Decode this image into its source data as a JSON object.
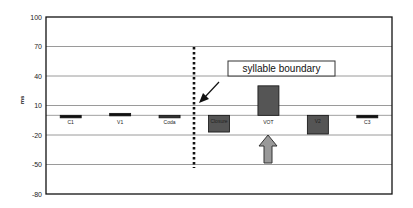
{
  "chart_data": {
    "type": "bar",
    "title": "",
    "xlabel": "",
    "ylabel": "ms",
    "ylim": [
      -80,
      100
    ],
    "yticks": [
      100,
      70,
      40,
      10,
      -20,
      -50,
      -80
    ],
    "grid": true,
    "legend": null,
    "categories": [
      "C1",
      "V1",
      "Coda",
      "Closure",
      "VOT",
      "V2",
      "C3"
    ],
    "values": [
      -1,
      2,
      -2,
      -17,
      30,
      -19,
      -1
    ],
    "bar_colors": [
      "#111111",
      "#111111",
      "#333333",
      "#555555",
      "#555555",
      "#555555",
      "#111111"
    ],
    "annotations": [
      {
        "type": "text_box",
        "text": "syllable boundary"
      },
      {
        "type": "dotted_vertical_line",
        "between": [
          "Coda",
          "Closure"
        ],
        "meaning": "syllable boundary"
      },
      {
        "type": "arrow",
        "direction": "down-left",
        "target": "syllable boundary line"
      },
      {
        "type": "block_arrow",
        "direction": "up",
        "target": "VOT",
        "color": "#999999"
      }
    ]
  },
  "labels": {
    "ylabel": "ms",
    "annotation": "syllable boundary"
  },
  "colors": {
    "background": "#ffffff",
    "axis": "#111111",
    "grid": "#9a9a9a",
    "bar_dark": "#111111",
    "bar_gray": "#5a5a5a",
    "block_arrow": "#999999"
  }
}
